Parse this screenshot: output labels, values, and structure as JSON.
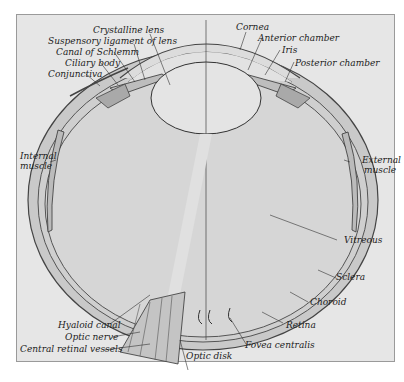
{
  "figure": {
    "labels": {
      "crystalline_lens": "Crystalline lens",
      "suspensory_ligament": "Suspensory ligament of lens",
      "canal_of_schlemm": "Canal of Schlemm",
      "ciliary_body": "Ciliary body",
      "conjunctiva": "Conjunctiva",
      "cornea": "Cornea",
      "anterior_chamber": "Anterior chamber",
      "iris": "Iris",
      "posterior_chamber": "Posterior chamber",
      "internal_muscle_1": "Internal",
      "internal_muscle_2": "muscle",
      "external_muscle_1": "External",
      "external_muscle_2": "muscle",
      "vitreous": "Vitreous",
      "sclera": "Sclera",
      "choroid": "Choroid",
      "retina": "Retina",
      "fovea_centralis": "Fovea centralis",
      "optic_disk": "Optic disk",
      "hyaloid_canal": "Hyaloid canal",
      "optic_nerve": "Optic nerve",
      "central_retinal_vessels": "Central retinal vessels"
    },
    "colors": {
      "background": "#e6e6e6",
      "sclera": "#c9c9c9",
      "vitreous": "#d6d6d6",
      "lens": "#e4e4e4",
      "ink": "#333333"
    }
  }
}
